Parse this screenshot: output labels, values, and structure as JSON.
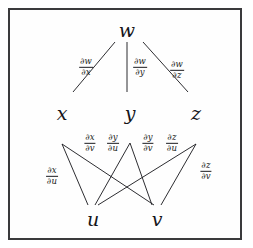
{
  "diagram": {
    "background_color": "#ffffff",
    "frame_color": "#3a3a3c",
    "ink_color": "#15151a",
    "nodes": [
      {
        "id": "w",
        "label": "w",
        "x": 127,
        "y": 30,
        "level": "top"
      },
      {
        "id": "x",
        "label": "x",
        "x": 62,
        "y": 113,
        "level": "middle"
      },
      {
        "id": "y",
        "label": "y",
        "x": 130,
        "y": 113,
        "level": "middle"
      },
      {
        "id": "z",
        "label": "z",
        "x": 196,
        "y": 113,
        "level": "middle"
      },
      {
        "id": "u",
        "label": "u",
        "x": 93,
        "y": 219,
        "level": "bottom"
      },
      {
        "id": "v",
        "label": "v",
        "x": 157,
        "y": 219,
        "level": "bottom"
      }
    ],
    "edges": [
      {
        "id": "w-x",
        "from": "w",
        "to": "x",
        "x1": 115,
        "y1": 42,
        "x2": 73,
        "y2": 92
      },
      {
        "id": "w-y",
        "from": "w",
        "to": "y",
        "x1": 127,
        "y1": 42,
        "x2": 127,
        "y2": 92
      },
      {
        "id": "w-z",
        "from": "w",
        "to": "z",
        "x1": 143,
        "y1": 42,
        "x2": 188,
        "y2": 92
      },
      {
        "id": "x-u",
        "from": "x",
        "to": "u",
        "x1": 62,
        "y1": 144,
        "x2": 88,
        "y2": 205
      },
      {
        "id": "x-v",
        "from": "x",
        "to": "v",
        "x1": 62,
        "y1": 144,
        "x2": 154,
        "y2": 205
      },
      {
        "id": "y-u",
        "from": "y",
        "to": "u",
        "x1": 130,
        "y1": 143,
        "x2": 95,
        "y2": 205
      },
      {
        "id": "y-v",
        "from": "y",
        "to": "v",
        "x1": 130,
        "y1": 143,
        "x2": 152,
        "y2": 205
      },
      {
        "id": "z-u",
        "from": "z",
        "to": "u",
        "x1": 196,
        "y1": 144,
        "x2": 98,
        "y2": 205
      },
      {
        "id": "z-v",
        "from": "z",
        "to": "v",
        "x1": 196,
        "y1": 144,
        "x2": 161,
        "y2": 205
      }
    ],
    "edge_labels": [
      {
        "id": "dw-dx",
        "edge": "w-x",
        "numerator": "∂w",
        "denominator": "∂x",
        "x": 86,
        "y": 67
      },
      {
        "id": "dw-dy",
        "edge": "w-y",
        "numerator": "∂w",
        "denominator": "∂y",
        "x": 140,
        "y": 67
      },
      {
        "id": "dw-dz",
        "edge": "w-z",
        "numerator": "∂w",
        "denominator": "∂z",
        "x": 177,
        "y": 70
      },
      {
        "id": "dx-dv",
        "edge": "x-v",
        "numerator": "∂x",
        "denominator": "∂v",
        "x": 90,
        "y": 143
      },
      {
        "id": "dy-du",
        "edge": "y-u",
        "numerator": "∂y",
        "denominator": "∂u",
        "x": 113,
        "y": 143
      },
      {
        "id": "dy-dv",
        "edge": "y-v",
        "numerator": "∂y",
        "denominator": "∂v",
        "x": 148,
        "y": 143
      },
      {
        "id": "dz-du",
        "edge": "z-u",
        "numerator": "∂z",
        "denominator": "∂u",
        "x": 172,
        "y": 143
      },
      {
        "id": "dx-du",
        "edge": "x-u",
        "numerator": "∂x",
        "denominator": "∂u",
        "x": 52,
        "y": 176
      },
      {
        "id": "dz-dv",
        "edge": "z-v",
        "numerator": "∂z",
        "denominator": "∂v",
        "x": 206,
        "y": 171
      }
    ]
  }
}
